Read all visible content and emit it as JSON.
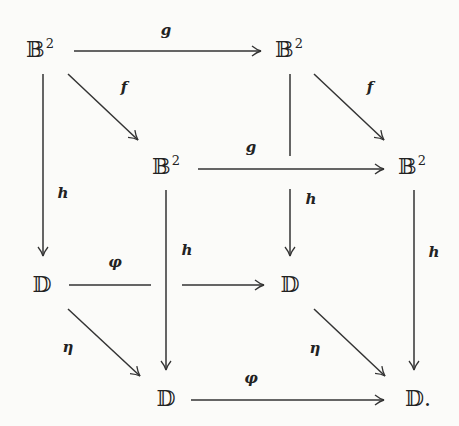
{
  "diagram": {
    "type": "commutative-cube",
    "nodes": {
      "b_tl": {
        "base": "𝔹",
        "sup": "2"
      },
      "b_tr": {
        "base": "𝔹",
        "sup": "2"
      },
      "b_ml": {
        "base": "𝔹",
        "sup": "2"
      },
      "b_mr": {
        "base": "𝔹",
        "sup": "2"
      },
      "d_ml": {
        "base": "𝔻",
        "sup": ""
      },
      "d_mr": {
        "base": "𝔻",
        "sup": ""
      },
      "d_bl": {
        "base": "𝔻",
        "sup": ""
      },
      "d_br": {
        "base": "𝔻.",
        "sup": ""
      }
    },
    "labels": {
      "g_top": "g",
      "f_left": "f",
      "f_right": "f",
      "g_mid": "g",
      "h_left": "h",
      "h_inner": "h",
      "h_mid": "h",
      "h_right": "h",
      "phi_top": "φ",
      "phi_bottom": "φ",
      "eta_left": "η",
      "eta_right": "η"
    },
    "edges": [
      {
        "from": "B² (top-left)",
        "to": "B² (top-right)",
        "label": "g"
      },
      {
        "from": "B² (top-left)",
        "to": "B² (front-left)",
        "label": "f"
      },
      {
        "from": "B² (top-right)",
        "to": "B² (front-right)",
        "label": "f"
      },
      {
        "from": "B² (front-left)",
        "to": "B² (front-right)",
        "label": "g"
      },
      {
        "from": "B² (top-left)",
        "to": "D (back-left)",
        "label": "h"
      },
      {
        "from": "B² (top-right)",
        "to": "D (back-right)",
        "label": "h"
      },
      {
        "from": "B² (front-left)",
        "to": "D (front-left)",
        "label": "h"
      },
      {
        "from": "B² (front-right)",
        "to": "D. (front-right)",
        "label": "h"
      },
      {
        "from": "D (back-left)",
        "to": "D (back-right)",
        "label": "φ"
      },
      {
        "from": "D (front-left)",
        "to": "D. (front-right)",
        "label": "φ"
      },
      {
        "from": "D (back-left)",
        "to": "D (front-left)",
        "label": "η"
      },
      {
        "from": "D (back-right)",
        "to": "D. (front-right)",
        "label": "η"
      }
    ]
  }
}
